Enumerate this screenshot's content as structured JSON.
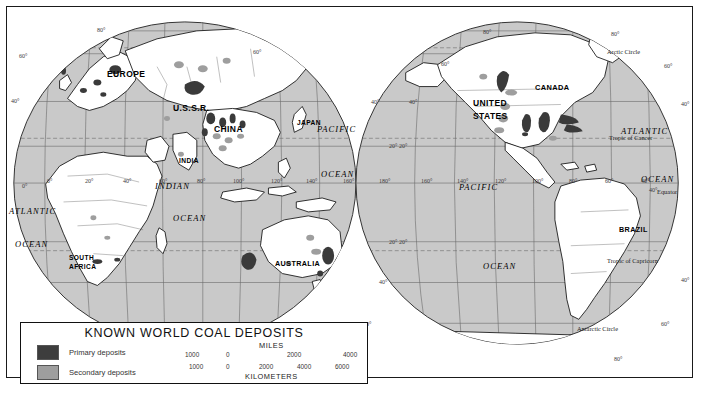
{
  "map": {
    "title": "KNOWN WORLD COAL DEPOSITS",
    "projection": "interrupted-mollweide-two-hemispheres",
    "colors": {
      "ocean": "#c9c9c9",
      "land": "#ffffff",
      "primary_deposit": "#3a3a3a",
      "secondary_deposit": "#9a9a9a",
      "graticule": "#6b6b6b",
      "coastline": "#111111",
      "border": "#1a1a1a"
    }
  },
  "legend": {
    "title": "KNOWN WORLD COAL DEPOSITS",
    "items": [
      {
        "label": "Primary deposits",
        "color": "#3d3d3d"
      },
      {
        "label": "Secondary deposits",
        "color": "#9e9e9e"
      }
    ],
    "scale": {
      "miles_caption": "MILES",
      "kilometers_caption": "KILOMETERS",
      "miles_ticks": [
        "1000",
        "0",
        "2000",
        "4000"
      ],
      "kilometers_ticks": [
        "1000",
        "0",
        "2000",
        "4000",
        "6000"
      ]
    }
  },
  "labels": {
    "countries": [
      {
        "name": "EUROPE",
        "x": 100,
        "y": 68,
        "size": 8.5
      },
      {
        "name": "U.S.S.R.",
        "x": 172,
        "y": 102,
        "size": 8.5
      },
      {
        "name": "CHINA",
        "x": 213,
        "y": 123,
        "size": 8.5
      },
      {
        "name": "JAPAN",
        "x": 294,
        "y": 118,
        "size": 6.6
      },
      {
        "name": "INDIA",
        "x": 178,
        "y": 156,
        "size": 6.6
      },
      {
        "name": "SOUTH",
        "x": 68,
        "y": 253,
        "size": 6.6
      },
      {
        "name": "AFRICA",
        "x": 68,
        "y": 262,
        "size": 6.6
      },
      {
        "name": "AUSTRALIA",
        "x": 276,
        "y": 258,
        "size": 7.2
      },
      {
        "name": "UNITED",
        "x": 482,
        "y": 97,
        "size": 8.5
      },
      {
        "name": "STATES",
        "x": 482,
        "y": 110,
        "size": 8.5
      },
      {
        "name": "CANADA",
        "x": 540,
        "y": 82,
        "size": 7.4
      },
      {
        "name": "BRAZIL",
        "x": 624,
        "y": 224,
        "size": 7.2
      }
    ],
    "oceans": [
      {
        "name": "PACIFIC",
        "x": 323,
        "y": 123,
        "size": 8.5
      },
      {
        "name": "OCEAN",
        "x": 326,
        "y": 168,
        "size": 8.5
      },
      {
        "name": "INDIAN",
        "x": 158,
        "y": 180,
        "size": 8.5
      },
      {
        "name": "OCEAN",
        "x": 175,
        "y": 212,
        "size": 8.5
      },
      {
        "name": "ATLANTIC",
        "x": 8,
        "y": 205,
        "size": 8.5
      },
      {
        "name": "OCEAN",
        "x": 14,
        "y": 238,
        "size": 8.5
      },
      {
        "name": "PACIFIC",
        "x": 466,
        "y": 181,
        "size": 8.5
      },
      {
        "name": "OCEAN",
        "x": 490,
        "y": 260,
        "size": 8.5
      },
      {
        "name": "ATLANTIC",
        "x": 628,
        "y": 125,
        "size": 8.5
      },
      {
        "name": "OCEAN",
        "x": 645,
        "y": 173,
        "size": 8.5
      }
    ],
    "circles": [
      {
        "name": "Arctic Circle",
        "x": 614,
        "y": 46
      },
      {
        "name": "Tropic of Cancer",
        "x": 617,
        "y": 132
      },
      {
        "name": "Equator",
        "x": 659,
        "y": 186
      },
      {
        "name": "Tropic of Capricorn",
        "x": 616,
        "y": 255
      },
      {
        "name": "Antarctic Circle",
        "x": 583,
        "y": 323
      }
    ],
    "latitudes_left_west": [
      {
        "v": "60°",
        "x": 18,
        "y": 52
      },
      {
        "v": "40°",
        "x": 10,
        "y": 97
      },
      {
        "v": "0°",
        "x": 21,
        "y": 182
      }
    ],
    "latitudes_left_east": [
      {
        "v": "80°",
        "x": 96,
        "y": 26
      },
      {
        "v": "60°",
        "x": 252,
        "y": 48
      },
      {
        "v": "40°",
        "x": 370,
        "y": 98
      },
      {
        "v": "20°",
        "x": 388,
        "y": 142
      },
      {
        "v": "20°",
        "x": 388,
        "y": 238
      },
      {
        "v": "40°",
        "x": 378,
        "y": 278
      },
      {
        "v": "60°",
        "x": 362,
        "y": 320
      },
      {
        "v": "80°",
        "x": 344,
        "y": 352
      }
    ],
    "latitudes_right": [
      {
        "v": "80°",
        "x": 482,
        "y": 28
      },
      {
        "v": "80°",
        "x": 610,
        "y": 30
      },
      {
        "v": "60°",
        "x": 440,
        "y": 60
      },
      {
        "v": "60°",
        "x": 663,
        "y": 62
      },
      {
        "v": "40°",
        "x": 408,
        "y": 98
      },
      {
        "v": "40°",
        "x": 680,
        "y": 100
      },
      {
        "v": "20°",
        "x": 398,
        "y": 142
      },
      {
        "v": "40°",
        "x": 648,
        "y": 186
      },
      {
        "v": "40°",
        "x": 680,
        "y": 276
      },
      {
        "v": "20°",
        "x": 398,
        "y": 238
      },
      {
        "v": "60°",
        "x": 660,
        "y": 320
      },
      {
        "v": "80°",
        "x": 613,
        "y": 355
      }
    ],
    "longitudes_left": [
      "0°",
      "20°",
      "40°",
      "60°",
      "80°",
      "100°",
      "120°",
      "140°",
      "160°",
      "180°"
    ],
    "longitudes_right": [
      "160°",
      "140°",
      "120°",
      "100°",
      "80°",
      "60°",
      "40°"
    ],
    "lon_left_pos": [
      {
        "v": "0°",
        "x": 46
      },
      {
        "v": "20°",
        "x": 84
      },
      {
        "v": "40°",
        "x": 122
      },
      {
        "v": "60°",
        "x": 158
      },
      {
        "v": "80°",
        "x": 196
      },
      {
        "v": "100°",
        "x": 232
      },
      {
        "v": "120°",
        "x": 270
      },
      {
        "v": "140°",
        "x": 305
      },
      {
        "v": "160°",
        "x": 342
      },
      {
        "v": "180°",
        "x": 378
      }
    ],
    "lon_right_pos": [
      {
        "v": "160°",
        "x": 420
      },
      {
        "v": "140°",
        "x": 456
      },
      {
        "v": "120°",
        "x": 494
      },
      {
        "v": "100°",
        "x": 531
      },
      {
        "v": "80°",
        "x": 568
      },
      {
        "v": "60°",
        "x": 604
      },
      {
        "v": "40°",
        "x": 640
      }
    ]
  }
}
